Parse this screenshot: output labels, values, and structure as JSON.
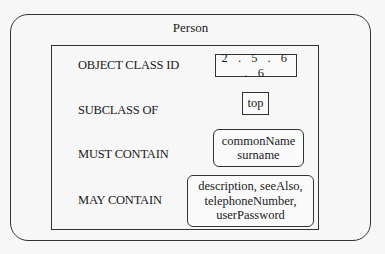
{
  "diagram": {
    "title": "Person",
    "rows": [
      {
        "label": "OBJECT CLASS ID",
        "value": "2 . 5 . 6 . 6"
      },
      {
        "label": "SUBCLASS OF",
        "value": "top"
      },
      {
        "label": "MUST CONTAIN",
        "value_lines": [
          "commonName",
          "surname"
        ]
      },
      {
        "label": "MAY CONTAIN",
        "value_lines": [
          "description, seeAlso,",
          "telephoneNumber,",
          "userPassword"
        ]
      }
    ]
  }
}
